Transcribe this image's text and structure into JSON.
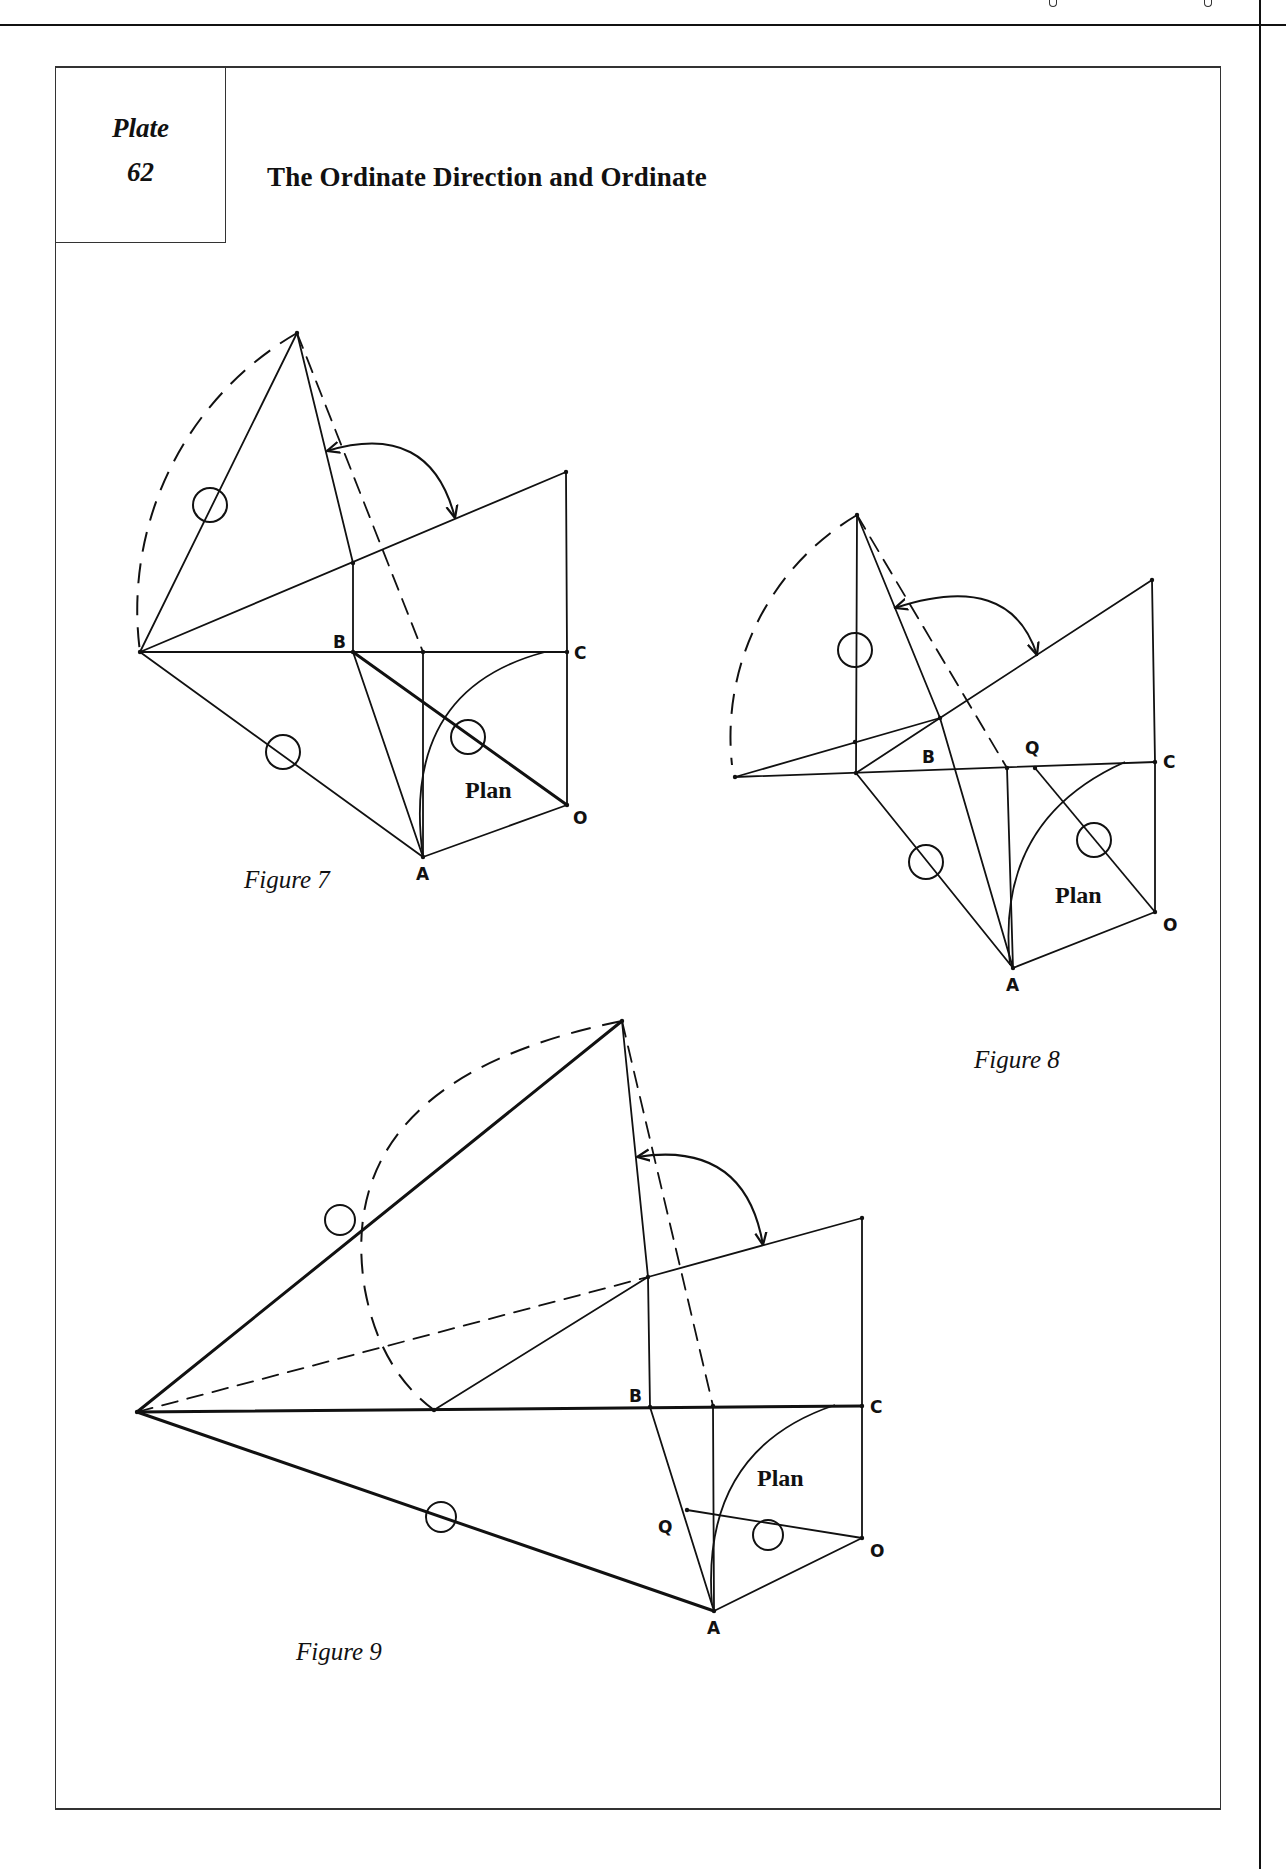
{
  "header": {
    "stub_marks_x": [
      1054,
      1209
    ]
  },
  "plate": {
    "label": "Plate",
    "number": "62",
    "title": "The Ordinate Direction and Ordinate"
  },
  "colors": {
    "ink": "#111111",
    "paper": "#ffffff"
  },
  "figures": [
    {
      "id": "figure-7",
      "caption": "Figure 7",
      "caption_pos": [
        244,
        866
      ],
      "plan_label": "Plan",
      "plan_pos": [
        465,
        777
      ],
      "points": {
        "T": [
          297,
          333
        ],
        "L": [
          140,
          652
        ],
        "B": [
          353,
          652
        ],
        "C": [
          567,
          652
        ],
        "R": [
          566,
          472
        ],
        "P": [
          353,
          563
        ],
        "D": [
          423,
          652
        ],
        "A": [
          423,
          857
        ],
        "O": [
          567,
          805
        ]
      },
      "labels": [
        {
          "text": "B",
          "x": 333,
          "y": 632
        },
        {
          "text": "C",
          "x": 574,
          "y": 643
        },
        {
          "text": "A",
          "x": 416,
          "y": 864
        },
        {
          "text": "O",
          "x": 573,
          "y": 808
        }
      ],
      "solid": [
        [
          "T",
          "L"
        ],
        [
          "T",
          "P"
        ],
        [
          "L",
          "R"
        ],
        [
          "R",
          "C"
        ],
        [
          "L",
          "C"
        ],
        [
          "B",
          "P"
        ],
        [
          "L",
          "A"
        ],
        [
          "B",
          "A"
        ],
        [
          "D",
          "A"
        ],
        [
          "A",
          "O"
        ],
        [
          "O",
          "C"
        ]
      ],
      "thick": [
        [
          "B",
          "O"
        ]
      ],
      "dashed": [
        [
          "T",
          "D"
        ]
      ],
      "dashed_arc": "M 297 333 A 320 320 0 0 0 140 652",
      "plan_arc": "M 423 857 Q 400 690 545 652",
      "angle_arc": "M 327 451 Q 430 420 455 518",
      "circles": [
        [
          210,
          505,
          17
        ],
        [
          283,
          752,
          17
        ],
        [
          468,
          737,
          17
        ]
      ]
    },
    {
      "id": "figure-8",
      "caption": "Figure 8",
      "caption_pos": [
        974,
        1046
      ],
      "plan_label": "Plan",
      "plan_pos": [
        1055,
        882
      ],
      "points": {
        "T": [
          857,
          515
        ],
        "L": [
          735,
          777
        ],
        "V": [
          856,
          773
        ],
        "B": [
          940,
          718
        ],
        "C": [
          1155,
          762
        ],
        "R": [
          1152,
          580
        ],
        "D": [
          1007,
          768
        ],
        "Q": [
          1035,
          768
        ],
        "A": [
          1013,
          968
        ],
        "O": [
          1155,
          912
        ],
        "M": [
          855,
          742
        ]
      },
      "labels": [
        {
          "text": "B",
          "x": 922,
          "y": 747
        },
        {
          "text": "Q",
          "x": 1025,
          "y": 738
        },
        {
          "text": "C",
          "x": 1163,
          "y": 752
        },
        {
          "text": "A",
          "x": 1006,
          "y": 975
        },
        {
          "text": "O",
          "x": 1163,
          "y": 915
        }
      ],
      "solid": [
        [
          "T",
          "V"
        ],
        [
          "T",
          "B"
        ],
        [
          "L",
          "B"
        ],
        [
          "B",
          "R"
        ],
        [
          "R",
          "C"
        ],
        [
          "L",
          "C"
        ],
        [
          "V",
          "B"
        ],
        [
          "V",
          "A"
        ],
        [
          "B",
          "A"
        ],
        [
          "D",
          "A"
        ],
        [
          "Q",
          "O"
        ],
        [
          "A",
          "O"
        ],
        [
          "O",
          "C"
        ]
      ],
      "thick": [],
      "dashed": [
        [
          "T",
          "D"
        ]
      ],
      "dashed_arc": "M 857 515 A 258 258 0 0 0 732 765",
      "plan_arc": "M 1010 965 Q 995 820 1125 762",
      "angle_arc": "M 895 608 Q 1010 570 1037 655",
      "circles": [
        [
          855,
          650,
          17
        ],
        [
          926,
          862,
          17
        ],
        [
          1094,
          840,
          17
        ]
      ]
    },
    {
      "id": "figure-9",
      "caption": "Figure 9",
      "caption_pos": [
        296,
        1638
      ],
      "plan_label": "Plan",
      "plan_pos": [
        757,
        1465
      ],
      "points": {
        "T": [
          622,
          1021
        ],
        "L": [
          137,
          1412
        ],
        "M": [
          434,
          1410
        ],
        "P": [
          648,
          1277
        ],
        "B": [
          650,
          1407
        ],
        "C": [
          862,
          1406
        ],
        "R": [
          862,
          1218
        ],
        "D": [
          713,
          1406
        ],
        "Q": [
          687,
          1510
        ],
        "A": [
          714,
          1611
        ],
        "O": [
          862,
          1538
        ]
      },
      "labels": [
        {
          "text": "B",
          "x": 629,
          "y": 1386
        },
        {
          "text": "C",
          "x": 870,
          "y": 1397
        },
        {
          "text": "Q",
          "x": 658,
          "y": 1517
        },
        {
          "text": "A",
          "x": 707,
          "y": 1618
        },
        {
          "text": "O",
          "x": 870,
          "y": 1541
        }
      ],
      "solid": [
        [
          "T",
          "P"
        ],
        [
          "P",
          "R"
        ],
        [
          "R",
          "C"
        ],
        [
          "M",
          "P"
        ],
        [
          "P",
          "B"
        ],
        [
          "B",
          "A"
        ],
        [
          "D",
          "A"
        ],
        [
          "Q",
          "O"
        ],
        [
          "A",
          "O"
        ],
        [
          "O",
          "C"
        ]
      ],
      "thick": [
        [
          "L",
          "T"
        ],
        [
          "L",
          "C"
        ],
        [
          "L",
          "A"
        ]
      ],
      "dashed": [
        [
          "T",
          "D"
        ],
        [
          "L",
          "P"
        ]
      ],
      "dashed_arc": "M 622 1021 Q 330 1080 365 1290 Q 380 1370 434 1410",
      "plan_arc": "M 712 1605 Q 700 1450 835 1405",
      "angle_arc": "M 637 1157 Q 745 1140 763 1245",
      "circles": [
        [
          340,
          1220,
          15
        ],
        [
          441,
          1517,
          15
        ],
        [
          768,
          1535,
          15
        ]
      ]
    }
  ]
}
